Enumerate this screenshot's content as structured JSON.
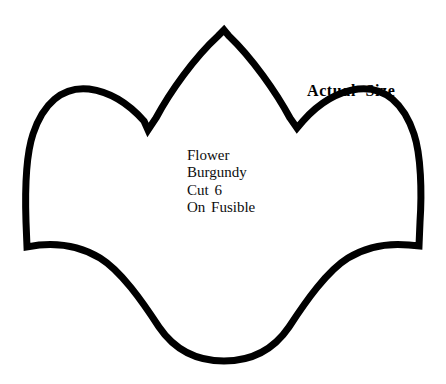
{
  "page": {
    "background_color": "#ffffff",
    "width": 446,
    "height": 384
  },
  "annotations": {
    "actual_size_note": "Actual  Size"
  },
  "instructions": {
    "lines": [
      "Flower",
      "Burgundy",
      "Cut 6",
      "On Fusible"
    ],
    "shape_name": "Flower",
    "fabric_color": "Burgundy",
    "cut_quantity": "Cut 6",
    "backing": "On Fusible"
  },
  "pattern_shape": {
    "name": "flower-petal-outline",
    "stroke_color": "#000000",
    "fill_color": "#ffffff",
    "stroke_width": 7,
    "path": "M 224 30 L 229 36 C 252 58 276 92 290 118 L 297 128 L 303 121 C 318 104 336 92 358 89 C 385 86 404 104 414 134 C 421 155 422 192 420 222 L 419 246 L 409 245 C 388 243 366 247 348 258 C 327 271 306 301 289 327 C 272 352 250 361 224 361 C 198 361 176 352 159 327 C 142 301 121 271 100 258 C 82 247 60 243 39 245 L 27 247 L 26 222 C 25 192 26 155 33 134 C 43 104 62 86 89 89 C 111 92 129 104 144 121 L 148 130 L 156 118 C 170 92 194 58 218 36 Z"
  }
}
